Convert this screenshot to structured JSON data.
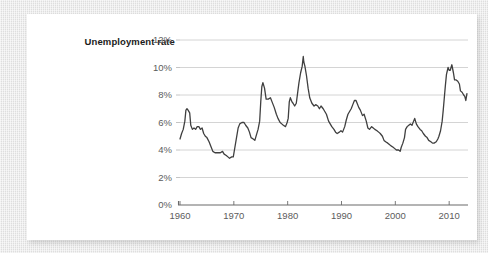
{
  "figure": {
    "series_label": "Unemployment rate"
  },
  "chart_data": {
    "type": "line",
    "title": "Unemployment rate",
    "xlabel": "",
    "ylabel": "Unemployment rate",
    "xlim": [
      1960,
      2013.5
    ],
    "ylim": [
      0,
      12
    ],
    "grid": true,
    "legend": "none",
    "yticks": [
      0,
      2,
      4,
      6,
      8,
      10,
      12
    ],
    "ytick_labels": [
      "0%",
      "2%",
      "4%",
      "6%",
      "8%",
      "10%",
      "12%"
    ],
    "xticks": [
      1960,
      1970,
      1980,
      1990,
      2000,
      2010
    ],
    "xtick_labels": [
      "1960",
      "1970",
      "1980",
      "1990",
      "2000",
      "2010"
    ],
    "line_color": "#3f3f3f",
    "line_width": 1.3,
    "series": [
      {
        "name": "Unemployment rate",
        "x": [
          1960.0,
          1960.3,
          1960.6,
          1960.9,
          1961.1,
          1961.3,
          1961.5,
          1961.8,
          1962.0,
          1962.3,
          1962.6,
          1962.9,
          1963.2,
          1963.5,
          1963.8,
          1964.1,
          1964.4,
          1964.7,
          1965.0,
          1965.4,
          1965.8,
          1966.1,
          1966.5,
          1966.9,
          1967.2,
          1967.5,
          1967.9,
          1968.2,
          1968.6,
          1968.9,
          1969.2,
          1969.6,
          1969.9,
          1970.2,
          1970.5,
          1970.8,
          1971.1,
          1971.5,
          1971.9,
          1972.2,
          1972.6,
          1972.9,
          1973.2,
          1973.6,
          1973.9,
          1974.2,
          1974.5,
          1974.8,
          1975.0,
          1975.2,
          1975.4,
          1975.7,
          1976.0,
          1976.4,
          1976.8,
          1977.1,
          1977.5,
          1977.9,
          1978.2,
          1978.6,
          1978.9,
          1979.2,
          1979.6,
          1979.9,
          1980.1,
          1980.3,
          1980.5,
          1980.8,
          1981.0,
          1981.3,
          1981.6,
          1981.9,
          1982.1,
          1982.4,
          1982.7,
          1982.9,
          1983.0,
          1983.2,
          1983.5,
          1983.8,
          1984.1,
          1984.5,
          1984.9,
          1985.2,
          1985.6,
          1985.9,
          1986.2,
          1986.6,
          1986.9,
          1987.2,
          1987.6,
          1987.9,
          1988.2,
          1988.6,
          1988.9,
          1989.2,
          1989.6,
          1989.9,
          1990.2,
          1990.6,
          1990.9,
          1991.2,
          1991.5,
          1991.8,
          1992.1,
          1992.4,
          1992.7,
          1992.9,
          1993.2,
          1993.5,
          1993.9,
          1994.2,
          1994.6,
          1994.9,
          1995.2,
          1995.6,
          1995.9,
          1996.2,
          1996.6,
          1996.9,
          1997.2,
          1997.6,
          1997.9,
          1998.2,
          1998.6,
          1998.9,
          1999.2,
          1999.6,
          1999.9,
          2000.2,
          2000.6,
          2000.9,
          2001.1,
          2001.4,
          2001.7,
          2001.9,
          2002.2,
          2002.5,
          2002.8,
          2003.1,
          2003.4,
          2003.6,
          2003.9,
          2004.2,
          2004.6,
          2004.9,
          2005.2,
          2005.6,
          2005.9,
          2006.2,
          2006.6,
          2006.9,
          2007.2,
          2007.6,
          2007.9,
          2008.1,
          2008.4,
          2008.7,
          2008.9,
          2009.1,
          2009.3,
          2009.5,
          2009.8,
          2010.0,
          2010.2,
          2010.5,
          2010.8,
          2011.0,
          2011.3,
          2011.6,
          2011.9,
          2012.1,
          2012.4,
          2012.7,
          2012.9,
          2013.1,
          2013.3
        ],
        "values": [
          4.8,
          5.2,
          5.5,
          6.1,
          6.9,
          7.0,
          6.9,
          6.7,
          5.8,
          5.5,
          5.6,
          5.5,
          5.7,
          5.7,
          5.5,
          5.6,
          5.2,
          5.0,
          4.9,
          4.6,
          4.2,
          3.9,
          3.8,
          3.8,
          3.8,
          3.8,
          3.9,
          3.7,
          3.6,
          3.5,
          3.4,
          3.5,
          3.5,
          4.2,
          4.9,
          5.6,
          5.9,
          6.0,
          6.0,
          5.8,
          5.6,
          5.3,
          4.9,
          4.8,
          4.7,
          5.1,
          5.5,
          6.1,
          7.5,
          8.6,
          8.9,
          8.5,
          7.7,
          7.7,
          7.8,
          7.5,
          7.1,
          6.6,
          6.3,
          6.0,
          5.9,
          5.8,
          5.7,
          6.0,
          6.3,
          7.5,
          7.8,
          7.5,
          7.4,
          7.2,
          7.4,
          8.3,
          8.9,
          9.6,
          10.1,
          10.8,
          10.4,
          10.1,
          9.4,
          8.5,
          7.8,
          7.4,
          7.2,
          7.3,
          7.2,
          7.0,
          7.2,
          7.0,
          6.8,
          6.6,
          6.1,
          5.9,
          5.7,
          5.5,
          5.3,
          5.2,
          5.3,
          5.4,
          5.3,
          5.7,
          6.2,
          6.6,
          6.8,
          7.0,
          7.3,
          7.6,
          7.6,
          7.4,
          7.1,
          6.9,
          6.5,
          6.6,
          6.1,
          5.6,
          5.5,
          5.7,
          5.6,
          5.5,
          5.4,
          5.3,
          5.2,
          5.0,
          4.7,
          4.6,
          4.5,
          4.4,
          4.3,
          4.2,
          4.1,
          4.0,
          4.0,
          3.9,
          4.2,
          4.5,
          4.9,
          5.5,
          5.7,
          5.8,
          5.9,
          5.8,
          6.1,
          6.3,
          5.9,
          5.7,
          5.5,
          5.4,
          5.2,
          5.0,
          4.9,
          4.7,
          4.6,
          4.5,
          4.5,
          4.6,
          4.8,
          5.0,
          5.4,
          6.1,
          6.9,
          7.8,
          8.7,
          9.5,
          10.0,
          9.8,
          9.8,
          10.2,
          9.6,
          9.1,
          9.1,
          9.0,
          8.8,
          8.3,
          8.2,
          8.0,
          7.9,
          7.6,
          8.1
        ]
      }
    ]
  },
  "axes": {
    "ytick_labels": [
      "12%",
      "10%",
      "8%",
      "6%",
      "4%",
      "2%",
      "0%"
    ],
    "xtick_labels": [
      "1960",
      "1970",
      "1980",
      "1990",
      "2000",
      "2010"
    ]
  }
}
